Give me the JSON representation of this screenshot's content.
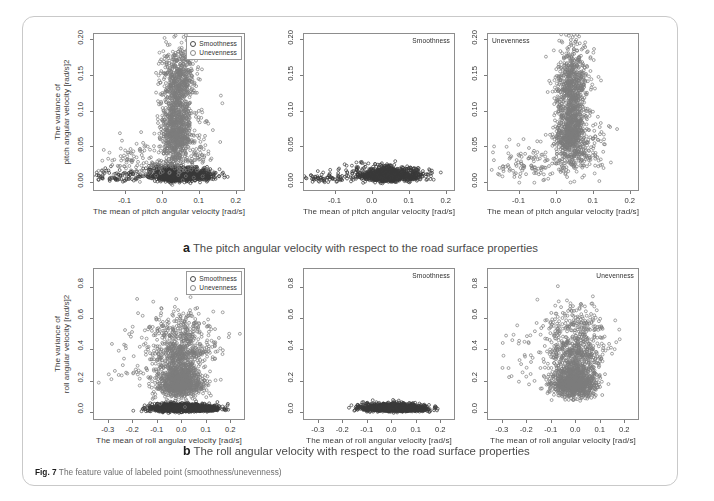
{
  "figure": {
    "number_label": "Fig. 7",
    "caption": "The feature value of labeled point (smoothness/unevenness)",
    "background_color": "#ffffff",
    "frame_color": "#c9c9c9"
  },
  "legend": {
    "items": [
      {
        "label": "Smoothness",
        "symbol": "open-circle",
        "color": "#3a3a3a"
      },
      {
        "label": "Unevenness",
        "symbol": "open-circle",
        "color": "#7d7d7d"
      }
    ]
  },
  "panels": {
    "a": {
      "letter": "a",
      "caption": "The pitch angular velocity with respect to the road surface properties",
      "xlabel": "The mean of pitch angular velocity  [rad/s]",
      "ylabel_line1": "The variance of",
      "ylabel_line2": "pitch angular velocity  [rad/s]2",
      "xticks": [
        "-0.1",
        "0.0",
        "0.1",
        "0.2"
      ],
      "yticks": [
        "0.00",
        "0.05",
        "0.10",
        "0.15",
        "0.20"
      ]
    },
    "b": {
      "letter": "b",
      "caption": "The roll angular velocity with respect to the road surface properties",
      "xlabel": "The mean of roll angular velocity  [rad/s]",
      "ylabel_line1": "The variance of",
      "ylabel_line2": "roll  angular velocity  [rad/s]2",
      "xticks": [
        "-0.3",
        "-0.2",
        "-0.1",
        "0.0",
        "0.1",
        "0.2"
      ],
      "yticks": [
        "0.0",
        "0.2",
        "0.4",
        "0.6",
        "0.8"
      ]
    }
  },
  "chart_data": [
    {
      "id": "a-left",
      "type": "scatter",
      "title": "",
      "corner_label": "",
      "show_legend": true,
      "xlabel": "The mean of pitch angular velocity  [rad/s]",
      "ylabel": "The variance of pitch angular velocity  [rad/s]2",
      "xlim": [
        -0.185,
        0.225
      ],
      "ylim": [
        -0.012,
        0.208
      ],
      "xticks": [
        -0.1,
        0.0,
        0.1,
        0.2
      ],
      "xticklabels": [
        "-0.1",
        "0.0",
        "0.1",
        "0.2"
      ],
      "yticks": [
        0.0,
        0.05,
        0.1,
        0.15,
        0.2
      ],
      "yticklabels": [
        "0.00",
        "0.05",
        "0.10",
        "0.15",
        "0.20"
      ],
      "grid": false,
      "legend_position": "top-right",
      "series": [
        {
          "name": "Smoothness",
          "color": "#3a3a3a",
          "marker": "open-circle",
          "n_points": 1400,
          "clusters": [
            {
              "cx": 0.035,
              "cy": 0.01,
              "sx": 0.022,
              "sy": 0.006,
              "weight": 0.62
            },
            {
              "cx": 0.095,
              "cy": 0.01,
              "sx": 0.028,
              "sy": 0.006,
              "weight": 0.2
            },
            {
              "cx": -0.005,
              "cy": 0.012,
              "sx": 0.03,
              "sy": 0.007,
              "weight": 0.12
            },
            {
              "cx": -0.12,
              "cy": 0.008,
              "sx": 0.045,
              "sy": 0.006,
              "weight": 0.06
            }
          ]
        },
        {
          "name": "Unevenness",
          "color": "#7d7d7d",
          "marker": "open-circle",
          "n_points": 1600,
          "clusters": [
            {
              "cx": 0.038,
              "cy": 0.075,
              "sx": 0.02,
              "sy": 0.04,
              "weight": 0.6
            },
            {
              "cx": 0.045,
              "cy": 0.145,
              "sx": 0.024,
              "sy": 0.028,
              "weight": 0.22
            },
            {
              "cx": 0.075,
              "cy": 0.045,
              "sx": 0.032,
              "sy": 0.03,
              "weight": 0.1
            },
            {
              "cx": -0.06,
              "cy": 0.025,
              "sx": 0.06,
              "sy": 0.018,
              "weight": 0.08
            }
          ]
        }
      ]
    },
    {
      "id": "a-middle",
      "type": "scatter",
      "corner_label": "Smoothness",
      "show_legend": false,
      "xlabel": "The mean of pitch angular velocity  [rad/s]",
      "ylabel": "",
      "xlim": [
        -0.185,
        0.225
      ],
      "ylim": [
        -0.012,
        0.208
      ],
      "xticks": [
        -0.1,
        0.0,
        0.1,
        0.2
      ],
      "xticklabels": [
        "-0.1",
        "0.0",
        "0.1",
        "0.2"
      ],
      "yticks": [
        0.0,
        0.05,
        0.1,
        0.15,
        0.2
      ],
      "yticklabels": [
        "0.00",
        "0.05",
        "0.10",
        "0.15",
        "0.20"
      ],
      "grid": false,
      "series": [
        {
          "name": "Smoothness",
          "color": "#3a3a3a",
          "marker": "open-circle",
          "n_points": 1400,
          "clusters": [
            {
              "cx": 0.035,
              "cy": 0.01,
              "sx": 0.022,
              "sy": 0.006,
              "weight": 0.62
            },
            {
              "cx": 0.095,
              "cy": 0.01,
              "sx": 0.028,
              "sy": 0.006,
              "weight": 0.2
            },
            {
              "cx": -0.005,
              "cy": 0.012,
              "sx": 0.03,
              "sy": 0.007,
              "weight": 0.12
            },
            {
              "cx": -0.12,
              "cy": 0.008,
              "sx": 0.045,
              "sy": 0.006,
              "weight": 0.06
            }
          ]
        }
      ]
    },
    {
      "id": "a-right",
      "type": "scatter",
      "corner_label": "Unevenness",
      "show_legend": false,
      "xlabel": "The mean of pitch angular velocity  [rad/s]",
      "ylabel": "",
      "xlim": [
        -0.185,
        0.225
      ],
      "ylim": [
        -0.012,
        0.208
      ],
      "xticks": [
        -0.1,
        0.0,
        0.1,
        0.2
      ],
      "xticklabels": [
        "-0.1",
        "0.0",
        "0.1",
        "0.2"
      ],
      "yticks": [
        0.0,
        0.05,
        0.1,
        0.15,
        0.2
      ],
      "yticklabels": [
        "0.00",
        "0.05",
        "0.10",
        "0.15",
        "0.20"
      ],
      "grid": false,
      "series": [
        {
          "name": "Unevenness",
          "color": "#7d7d7d",
          "marker": "open-circle",
          "n_points": 1600,
          "clusters": [
            {
              "cx": 0.038,
              "cy": 0.075,
              "sx": 0.02,
              "sy": 0.04,
              "weight": 0.6
            },
            {
              "cx": 0.045,
              "cy": 0.145,
              "sx": 0.024,
              "sy": 0.028,
              "weight": 0.22
            },
            {
              "cx": 0.075,
              "cy": 0.045,
              "sx": 0.032,
              "sy": 0.03,
              "weight": 0.1
            },
            {
              "cx": -0.06,
              "cy": 0.025,
              "sx": 0.06,
              "sy": 0.018,
              "weight": 0.08
            }
          ]
        }
      ]
    },
    {
      "id": "b-left",
      "type": "scatter",
      "corner_label": "",
      "show_legend": true,
      "xlabel": "The mean of roll angular velocity  [rad/s]",
      "ylabel": "The variance of roll angular velocity  [rad/s]2",
      "xlim": [
        -0.36,
        0.26
      ],
      "ylim": [
        -0.05,
        0.92
      ],
      "xticks": [
        -0.3,
        -0.2,
        -0.1,
        0.0,
        0.1,
        0.2
      ],
      "xticklabels": [
        "-0.3",
        "-0.2",
        "-0.1",
        "0.0",
        "0.1",
        "0.2"
      ],
      "yticks": [
        0.0,
        0.2,
        0.4,
        0.6,
        0.8
      ],
      "yticklabels": [
        "0.0",
        "0.2",
        "0.4",
        "0.6",
        "0.8"
      ],
      "grid": false,
      "legend_position": "top-right",
      "series": [
        {
          "name": "Smoothness",
          "color": "#3a3a3a",
          "marker": "open-circle",
          "n_points": 1400,
          "clusters": [
            {
              "cx": -0.012,
              "cy": 0.03,
              "sx": 0.055,
              "sy": 0.016,
              "weight": 0.8
            },
            {
              "cx": 0.085,
              "cy": 0.026,
              "sx": 0.04,
              "sy": 0.013,
              "weight": 0.2
            }
          ]
        },
        {
          "name": "Unevenness",
          "color": "#7d7d7d",
          "marker": "open-circle",
          "n_points": 1700,
          "clusters": [
            {
              "cx": -0.01,
              "cy": 0.19,
              "sx": 0.045,
              "sy": 0.075,
              "weight": 0.66
            },
            {
              "cx": 0.0,
              "cy": 0.4,
              "sx": 0.065,
              "sy": 0.08,
              "weight": 0.22
            },
            {
              "cx": -0.01,
              "cy": 0.56,
              "sx": 0.075,
              "sy": 0.075,
              "weight": 0.08
            },
            {
              "cx": -0.15,
              "cy": 0.3,
              "sx": 0.09,
              "sy": 0.12,
              "weight": 0.04
            }
          ]
        }
      ]
    },
    {
      "id": "b-middle",
      "type": "scatter",
      "corner_label": "Smoothness",
      "show_legend": false,
      "xlabel": "The mean of roll angular velocity  [rad/s]",
      "ylabel": "",
      "xlim": [
        -0.36,
        0.26
      ],
      "ylim": [
        -0.05,
        0.92
      ],
      "xticks": [
        -0.3,
        -0.2,
        -0.1,
        0.0,
        0.1,
        0.2
      ],
      "xticklabels": [
        "-0.3",
        "-0.2",
        "-0.1",
        "0.0",
        "0.1",
        "0.2"
      ],
      "yticks": [
        0.0,
        0.2,
        0.4,
        0.6,
        0.8
      ],
      "yticklabels": [
        "0.0",
        "0.2",
        "0.4",
        "0.6",
        "0.8"
      ],
      "grid": false,
      "series": [
        {
          "name": "Smoothness",
          "color": "#3a3a3a",
          "marker": "open-circle",
          "n_points": 1400,
          "clusters": [
            {
              "cx": -0.012,
              "cy": 0.03,
              "sx": 0.055,
              "sy": 0.016,
              "weight": 0.8
            },
            {
              "cx": 0.085,
              "cy": 0.026,
              "sx": 0.04,
              "sy": 0.013,
              "weight": 0.2
            }
          ]
        }
      ]
    },
    {
      "id": "b-right",
      "type": "scatter",
      "corner_label": "Unevenness",
      "show_legend": false,
      "xlabel": "The mean of roll angular velocity  [rad/s]",
      "ylabel": "",
      "xlim": [
        -0.36,
        0.26
      ],
      "ylim": [
        -0.05,
        0.92
      ],
      "xticks": [
        -0.3,
        -0.2,
        -0.1,
        0.0,
        0.1,
        0.2
      ],
      "xticklabels": [
        "-0.3",
        "-0.2",
        "-0.1",
        "0.0",
        "0.1",
        "0.2"
      ],
      "yticks": [
        0.0,
        0.2,
        0.4,
        0.6,
        0.8
      ],
      "yticklabels": [
        "0.0",
        "0.2",
        "0.4",
        "0.6",
        "0.8"
      ],
      "grid": false,
      "series": [
        {
          "name": "Unevenness",
          "color": "#7d7d7d",
          "marker": "open-circle",
          "n_points": 1700,
          "clusters": [
            {
              "cx": -0.01,
              "cy": 0.19,
              "sx": 0.045,
              "sy": 0.075,
              "weight": 0.66
            },
            {
              "cx": 0.0,
              "cy": 0.4,
              "sx": 0.065,
              "sy": 0.08,
              "weight": 0.22
            },
            {
              "cx": -0.01,
              "cy": 0.56,
              "sx": 0.075,
              "sy": 0.075,
              "weight": 0.08
            },
            {
              "cx": -0.15,
              "cy": 0.3,
              "sx": 0.09,
              "sy": 0.12,
              "weight": 0.04
            }
          ]
        }
      ]
    }
  ]
}
